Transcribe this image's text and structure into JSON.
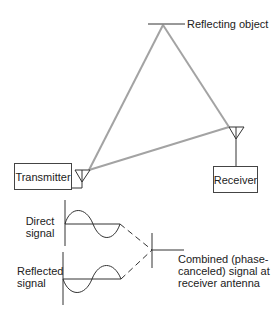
{
  "diagram": {
    "labels": {
      "reflecting_object": "Reflecting object",
      "transmitter": "Transmitter",
      "receiver": "Receiver",
      "direct_line1": "Direct",
      "direct_line2": "signal",
      "reflected_line1": "Reflected",
      "reflected_line2": "signal",
      "combined_line1": "Combined (phase-",
      "combined_line2": "canceled) signal at",
      "combined_line3": "receiver antenna"
    },
    "colors": {
      "path_lines": "#a0a0a0",
      "ink": "#333333"
    }
  }
}
